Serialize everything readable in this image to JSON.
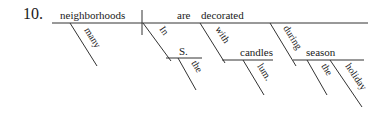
{
  "diagram": {
    "number": "10.",
    "subject": "neighborhoods",
    "subject_modifier": "many",
    "verb_aux": "are",
    "verb": "decorated",
    "phrases": [
      {
        "preposition": "In",
        "object": "S.",
        "modifiers": [
          "the"
        ]
      },
      {
        "preposition": "with",
        "object": "candles",
        "modifiers": [
          "lum."
        ]
      },
      {
        "preposition": "during",
        "object": "season",
        "modifiers": [
          "the",
          "holiday"
        ]
      }
    ],
    "colors": {
      "line": "#333333",
      "text": "#1a1a1a",
      "background": "#ffffff"
    }
  }
}
